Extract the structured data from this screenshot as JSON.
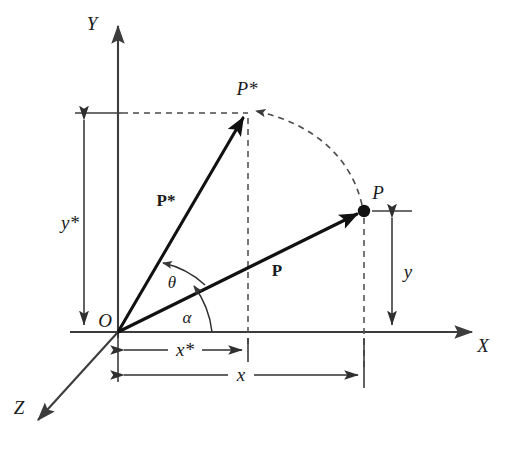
{
  "figure": {
    "background_color": "#ffffff",
    "ink_color": "#111111"
  },
  "axes": [
    {
      "name": "y-axis",
      "label": "Y",
      "direction": "up"
    },
    {
      "name": "x-axis",
      "label": "X",
      "direction": "right"
    },
    {
      "name": "z-axis",
      "label": "Z",
      "direction": "down-left"
    }
  ],
  "labels": {
    "y_axis": "Y",
    "x_axis": "X",
    "z_axis": "Z",
    "origin": "O",
    "point_p": "P",
    "point_p_star": "P*",
    "vector_p": "P",
    "vector_p_star": "P*",
    "angle_theta": "θ",
    "angle_alpha": "α",
    "dim_x": "x",
    "dim_x_star": "x*",
    "dim_y": "y",
    "dim_y_star": "y*"
  },
  "geometry": {
    "origin": {
      "x": 118,
      "y": 332
    },
    "point_p": {
      "x": 364,
      "y": 211
    },
    "point_p_star": {
      "x": 248,
      "y": 113
    },
    "x_axis_tip": {
      "x": 478,
      "y": 332
    },
    "y_axis_tip": {
      "x": 118,
      "y": 22
    },
    "z_axis_tip": {
      "x": 33,
      "y": 425
    },
    "dim_x_star_y": 350,
    "dim_x_y": 375,
    "dim_y_star_x": 84,
    "dim_y_x": 392
  },
  "annotations": {
    "rotation_arc": "dashed arc from P to P* indicating rotation by theta",
    "projection_lines": "dashed drop-lines from P and P* to the axes"
  }
}
